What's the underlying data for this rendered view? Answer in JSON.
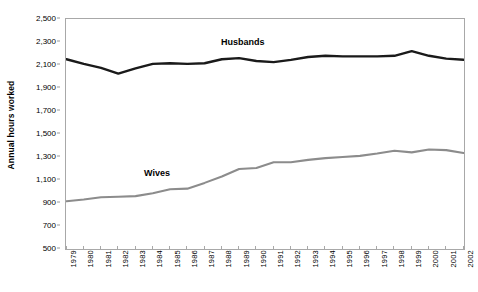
{
  "chart_data": {
    "type": "line",
    "title": "",
    "subtitle": "",
    "xlabel": "",
    "ylabel": "Annual hours worked",
    "ylim": [
      500,
      2500
    ],
    "ytick_step": 200,
    "ytick_labels": [
      "2,500",
      "2,300",
      "2,100",
      "1,900",
      "1,700",
      "1,500",
      "1,300",
      "1,100",
      "900",
      "700",
      "500"
    ],
    "ytick_values": [
      2500,
      2300,
      2100,
      1900,
      1700,
      1500,
      1300,
      1100,
      900,
      700,
      500
    ],
    "grid": false,
    "legend_position": "inline-annotations",
    "categories": [
      "1979",
      "1980",
      "1981",
      "1982",
      "1983",
      "1984",
      "1985",
      "1986",
      "1987",
      "1988",
      "1989",
      "1990",
      "1991",
      "1992",
      "1993",
      "1994",
      "1995",
      "1996",
      "1997",
      "1998",
      "1999",
      "2000",
      "2001",
      "2002"
    ],
    "x": [
      1979,
      1980,
      1981,
      1982,
      1983,
      1984,
      1985,
      1986,
      1987,
      1988,
      1989,
      1990,
      1991,
      1992,
      1993,
      1994,
      1995,
      1996,
      1997,
      1998,
      1999,
      2000,
      2001,
      2002
    ],
    "series": [
      {
        "name": "Husbands",
        "color": "#1a1a1a",
        "values": [
          2150,
          2110,
          2075,
          2025,
          2070,
          2110,
          2115,
          2110,
          2115,
          2150,
          2160,
          2135,
          2125,
          2145,
          2170,
          2180,
          2175,
          2175,
          2175,
          2180,
          2220,
          2180,
          2155,
          2145
        ]
      },
      {
        "name": "Wives",
        "color": "#8c8c8c",
        "values": [
          915,
          930,
          950,
          955,
          960,
          985,
          1020,
          1025,
          1075,
          1130,
          1195,
          1205,
          1255,
          1255,
          1275,
          1290,
          1300,
          1310,
          1330,
          1355,
          1340,
          1365,
          1360,
          1335
        ]
      }
    ],
    "annotations": [
      {
        "text": "Husbands",
        "series": "Husbands"
      },
      {
        "text": "Wives",
        "series": "Wives"
      }
    ]
  },
  "axes": {
    "y_title": "Annual hours worked"
  }
}
